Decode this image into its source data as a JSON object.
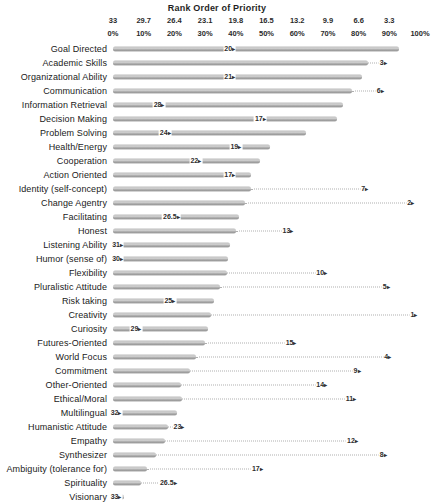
{
  "header": {
    "title": "Rank Order of Priority"
  },
  "colors": {
    "bar": "#a8a8a8",
    "bar_highlight": "#d2d2d2",
    "text": "#1f1f1f",
    "leader_line": "#b0b0b0",
    "background": "#ffffff"
  },
  "chart_data": {
    "type": "bar",
    "orientation": "horizontal",
    "title": "Rank Order of Priority",
    "top_axis": {
      "rank_ticks": [
        "33",
        "29.7",
        "26.4",
        "23.1",
        "19.8",
        "16.5",
        "13.2",
        "9.9",
        "6.6",
        "3.3"
      ],
      "rank_tick_positions_pct": [
        0,
        10,
        20,
        30,
        40,
        50,
        60,
        70,
        80,
        90
      ],
      "percent_ticks": [
        "0%",
        "10%",
        "20%",
        "30%",
        "40%",
        "50%",
        "60%",
        "70%",
        "80%",
        "90%",
        "100%"
      ],
      "percent_tick_positions_pct": [
        0,
        10,
        20,
        30,
        40,
        50,
        60,
        70,
        80,
        90,
        100
      ]
    },
    "xlim": [
      0,
      100
    ],
    "grid": false,
    "legend": "none",
    "note": "Each row shows a percentage bar plus a rank marker (number with right-pointing arrow); dotted leader connects bar end to rank marker when the marker lies beyond the bar.",
    "rows": [
      {
        "label": "Goal Directed",
        "percent": 93,
        "rank": "20",
        "rank_pos_pct": 38
      },
      {
        "label": "Academic Skills",
        "percent": 83,
        "rank": "3",
        "rank_pos_pct": 88
      },
      {
        "label": "Organizational Ability",
        "percent": 81,
        "rank": "21",
        "rank_pos_pct": 38
      },
      {
        "label": "Communication",
        "percent": 78,
        "rank": "6",
        "rank_pos_pct": 87
      },
      {
        "label": "Information Retrieval",
        "percent": 75,
        "rank": "28",
        "rank_pos_pct": 15
      },
      {
        "label": "Decision Making",
        "percent": 73,
        "rank": "17",
        "rank_pos_pct": 48
      },
      {
        "label": "Problem Solving",
        "percent": 63,
        "rank": "24",
        "rank_pos_pct": 17
      },
      {
        "label": "Health/Energy",
        "percent": 51,
        "rank": "19",
        "rank_pos_pct": 40
      },
      {
        "label": "Cooperation",
        "percent": 48,
        "rank": "22",
        "rank_pos_pct": 27
      },
      {
        "label": "Action Oriented",
        "percent": 45,
        "rank": "17",
        "rank_pos_pct": 38
      },
      {
        "label": "Identity (self-concept)",
        "percent": 45,
        "rank": "7",
        "rank_pos_pct": 82
      },
      {
        "label": "Change Agentry",
        "percent": 43,
        "rank": "2",
        "rank_pos_pct": 97
      },
      {
        "label": "Facilitating",
        "percent": 41,
        "rank": "26.5",
        "rank_pos_pct": 19
      },
      {
        "label": "Honest",
        "percent": 40,
        "rank": "13",
        "rank_pos_pct": 57
      },
      {
        "label": "Listening Ability",
        "percent": 38,
        "rank": "31",
        "rank_pos_pct": 1.5
      },
      {
        "label": "Humor (sense of)",
        "percent": 37.5,
        "rank": "30",
        "rank_pos_pct": 1.5
      },
      {
        "label": "Flexibility",
        "percent": 37,
        "rank": "10",
        "rank_pos_pct": 68
      },
      {
        "label": "Pluralistic Attitude",
        "percent": 35,
        "rank": "5",
        "rank_pos_pct": 89
      },
      {
        "label": "Risk taking",
        "percent": 33,
        "rank": "25",
        "rank_pos_pct": 18.5
      },
      {
        "label": "Creativity",
        "percent": 32,
        "rank": "1",
        "rank_pos_pct": 98
      },
      {
        "label": "Curiosity",
        "percent": 31,
        "rank": "29",
        "rank_pos_pct": 7.5
      },
      {
        "label": "Futures-Oriented",
        "percent": 30,
        "rank": "15",
        "rank_pos_pct": 58
      },
      {
        "label": "World Focus",
        "percent": 27,
        "rank": "4",
        "rank_pos_pct": 89.5
      },
      {
        "label": "Commitment",
        "percent": 25,
        "rank": "9",
        "rank_pos_pct": 79.5
      },
      {
        "label": "Other-Oriented",
        "percent": 22,
        "rank": "14",
        "rank_pos_pct": 68
      },
      {
        "label": "Ethical/Moral",
        "percent": 22.5,
        "rank": "11",
        "rank_pos_pct": 77.5
      },
      {
        "label": "Multilingual",
        "percent": 21,
        "rank": "32",
        "rank_pos_pct": 1
      },
      {
        "label": "Humanistic Attitude",
        "percent": 18,
        "rank": "23",
        "rank_pos_pct": 21.5
      },
      {
        "label": "Empathy",
        "percent": 17,
        "rank": "12",
        "rank_pos_pct": 78
      },
      {
        "label": "Synthesizer",
        "percent": 14,
        "rank": "8",
        "rank_pos_pct": 88
      },
      {
        "label": "Ambiguity (tolerance for)",
        "percent": 11,
        "rank": "17",
        "rank_pos_pct": 47
      },
      {
        "label": "Spirituality",
        "percent": 9,
        "rank": "26.5",
        "rank_pos_pct": 18
      },
      {
        "label": "Visionary",
        "percent": 3.5,
        "rank": "33",
        "rank_pos_pct": 1
      }
    ]
  }
}
